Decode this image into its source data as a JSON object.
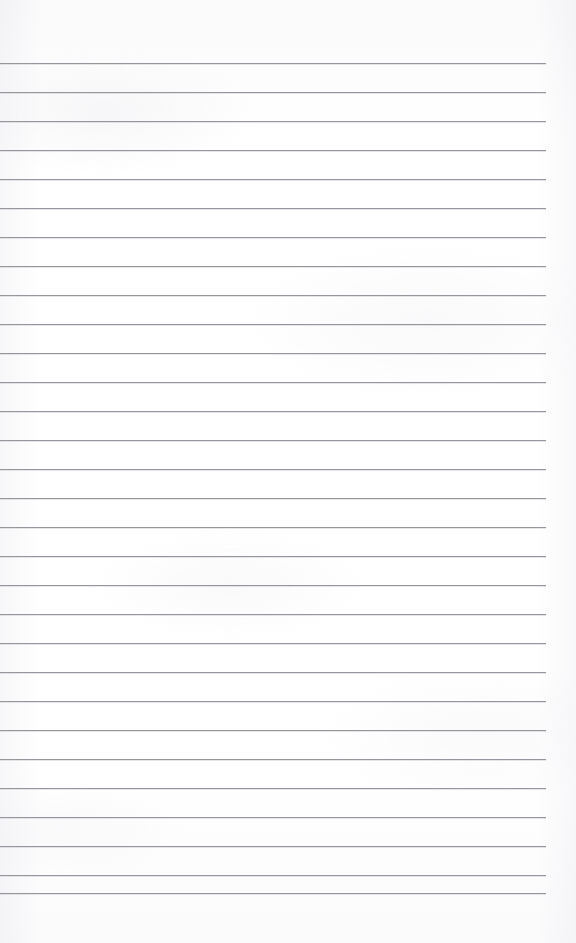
{
  "document": {
    "kind": "lined-paper-sheet",
    "title": "Blank lined paper",
    "content_text": "",
    "written_lines": [],
    "page_width_px": 576,
    "page_height_px": 943,
    "background_color": "#fdfdfd",
    "paper_tint_color": "#fafafb"
  },
  "ruling": {
    "line_color": "#8e8e96",
    "line_thickness_px": 1,
    "line_spacing_px": 29,
    "first_line_y_px": 63,
    "last_line_y_px": 893,
    "line_start_x_px": 0,
    "line_end_x_px": 546,
    "line_length_px": 546,
    "right_margin_px": 30,
    "top_margin_px": 63,
    "bottom_margin_px": 50,
    "line_count": 30,
    "has_vertical_margin_rule": false,
    "line_y_positions": [
      63,
      92,
      121,
      150,
      179,
      208,
      237,
      266,
      295,
      324,
      353,
      382,
      411,
      440,
      469,
      498,
      527,
      556,
      585,
      614,
      643,
      672,
      701,
      730,
      759,
      788,
      817,
      846,
      875,
      893
    ]
  }
}
